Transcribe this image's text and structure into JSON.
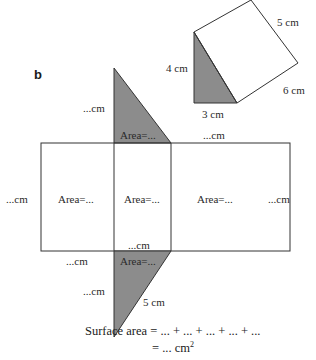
{
  "colors": {
    "shade": "#8c8c8c",
    "stroke": "#333333",
    "text": "#2a2a2a"
  },
  "part_label": "b",
  "prism": {
    "triangle_height": "4 cm",
    "triangle_base": "3 cm",
    "hypotenuse": "5 cm",
    "length": "6 cm"
  },
  "net": {
    "top_triangle_side": "...cm",
    "top_triangle_area": "Area=...",
    "top_edge_label": "...cm",
    "left_edge_label": "...cm",
    "right_edge_label": "...cm",
    "rect_left_area": "Area=...",
    "rect_middle_area": "Area=...",
    "rect_right_area": "Area=...",
    "middle_bottom_label": "...cm",
    "bottom_left_label": "...cm",
    "bottom_triangle_area": "Area=...",
    "bottom_triangle_side": "...cm",
    "bottom_triangle_hypotenuse": "5 cm"
  },
  "formula": {
    "line1": "Surface area = ... + ... + ... + ... + ...",
    "line2_prefix": "= ... cm",
    "line2_sup": "2"
  }
}
